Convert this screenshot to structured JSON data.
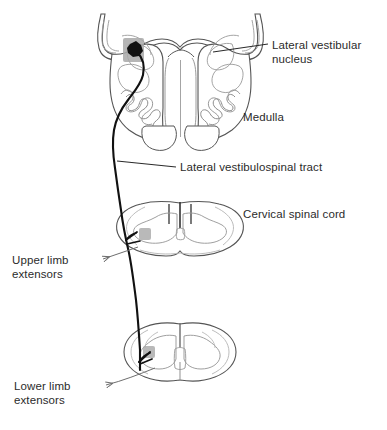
{
  "figure": {
    "background_color": "#ffffff",
    "ink_color": "#2b2b2b",
    "outline_color": "#555555",
    "faint_outline_color": "#9a9a9a",
    "nucleus_patch_color": "#9e9e9e",
    "tract_color": "#111111"
  },
  "labels": {
    "lateral_vestibular_nucleus": "Lateral vestibular\nnucleus",
    "medulla": "Medulla",
    "lateral_vestibulospinal_tract": "Lateral vestibulospinal tract",
    "cervical_spinal_cord": "Cervical spinal cord",
    "upper_limb_extensors": "Upper limb\nextensors",
    "lower_limb_extensors": "Lower limb\nextensors"
  },
  "structures": [
    {
      "name": "medulla-section",
      "label": "Medulla"
    },
    {
      "name": "cervical-cord-section",
      "label": "Cervical spinal cord"
    },
    {
      "name": "lumbar-cord-section",
      "label": "Lower limb extensors"
    }
  ],
  "annotations": {
    "leader_lines": 4,
    "arrowheads": 2
  }
}
